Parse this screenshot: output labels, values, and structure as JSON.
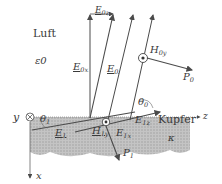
{
  "diagram": {
    "media": {
      "upper": {
        "name": "Luft",
        "permittivity": "ε0"
      },
      "lower": {
        "name": "Kupfer",
        "conductivity": "κ"
      }
    },
    "axes": {
      "x": "x",
      "y": "y",
      "z": "z"
    },
    "labels": {
      "E0z": {
        "main": "E",
        "sub": "0z"
      },
      "E0x": {
        "main": "E",
        "sub": "0x"
      },
      "E0": {
        "main": "E",
        "sub": "0"
      },
      "H0y": {
        "main": "H",
        "sub": "0y"
      },
      "P0": {
        "main": "P",
        "sub": "0"
      },
      "theta0": {
        "main": "θ",
        "sub": "0"
      },
      "theta1": {
        "main": "θ",
        "sub": "1"
      },
      "E1": {
        "main": "E",
        "sub": "1"
      },
      "H1y": {
        "main": "H",
        "sub": "1y"
      },
      "E1x": {
        "main": "E",
        "sub": "1x"
      },
      "E1z": {
        "main": "E",
        "sub": "1z"
      },
      "P1": {
        "main": "P",
        "sub": "1"
      }
    },
    "colors": {
      "line": "#4a4a4a",
      "copper_fill": "#b8b8b8",
      "text": "#3a3a3a"
    }
  }
}
